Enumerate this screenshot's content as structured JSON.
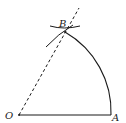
{
  "diagram": {
    "type": "geometric-construction",
    "points": {
      "O": {
        "label": "O",
        "x": 19,
        "y": 115
      },
      "A": {
        "label": "A",
        "x": 111,
        "y": 115
      },
      "B": {
        "label": "B",
        "x": 65,
        "y": 32
      }
    },
    "elements": [
      {
        "kind": "segment",
        "from": "O",
        "to": "A",
        "style": "solid"
      },
      {
        "kind": "arc",
        "center": "O",
        "from": "A",
        "to": "B",
        "style": "solid"
      },
      {
        "kind": "ray",
        "from": "O",
        "through": "B",
        "style": "dashed"
      },
      {
        "kind": "construction-arc",
        "near": "B",
        "count": 2,
        "style": "solid"
      }
    ],
    "colors": {
      "stroke": "#1a1a1a",
      "background": "#ffffff"
    }
  }
}
